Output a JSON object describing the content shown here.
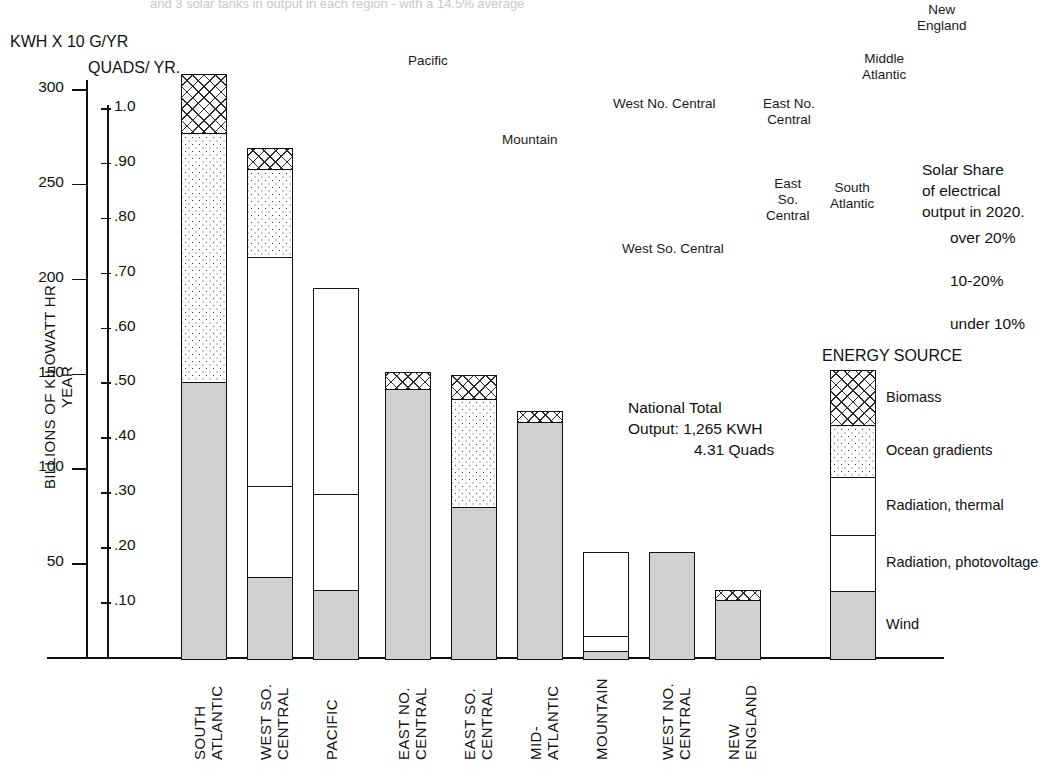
{
  "figure": {
    "cut_top_caption": "and 3 solar tanks in output in each region - with a 14.5% average",
    "kwh_header": "KWH X 10 G/YR",
    "quads_header": "QUADS/\nYR.",
    "y_axis_title": "BILLIONS OF KILOWATT HR YEAR",
    "national_total": "National Total\nOutput: 1,265 KWH\n        4.31 Quads",
    "solar_share_note": "Solar Share\nof electrical\noutput in 2020.",
    "share_bands": [
      "over 20%",
      "10-20%",
      "under 10%"
    ],
    "legend_title": "ENERGY SOURCE"
  },
  "map_region_labels": [
    {
      "name": "Pacific",
      "x": 408,
      "y": 53
    },
    {
      "name": "Mountain",
      "x": 502,
      "y": 132
    },
    {
      "name": "West No. Central",
      "x": 613,
      "y": 96
    },
    {
      "name": "West So. Central",
      "x": 622,
      "y": 241
    },
    {
      "name": "East No.\nCentral",
      "x": 763,
      "y": 96
    },
    {
      "name": "East\nSo.\nCentral",
      "x": 766,
      "y": 176
    },
    {
      "name": "South\nAtlantic",
      "x": 830,
      "y": 180
    },
    {
      "name": "Middle\nAtlantic",
      "x": 862,
      "y": 51
    },
    {
      "name": "New\nEngland",
      "x": 917,
      "y": 2
    }
  ],
  "chart_data": {
    "type": "bar",
    "subtype": "stacked",
    "xlabel": "",
    "ylabel": "BILLIONS OF KILOWATT HR YEAR",
    "ylim": [
      0,
      320
    ],
    "yticks": [
      50,
      100,
      150,
      200,
      250,
      300
    ],
    "secondary_axis": {
      "label": "QUADS/YR.",
      "ticks": [
        ".10",
        ".20",
        ".30",
        ".40",
        ".50",
        ".60",
        ".70",
        ".80",
        ".90",
        "1.0"
      ],
      "values": [
        0.1,
        0.2,
        0.3,
        0.4,
        0.5,
        0.6,
        0.7,
        0.8,
        0.9,
        1.0
      ],
      "range": [
        0,
        1.07
      ]
    },
    "grid": false,
    "legend_position": "right",
    "categories": [
      "SOUTH\nATLANTIC",
      "WEST SO.\nCENTRAL",
      "PACIFIC",
      "EAST NO.\nCENTRAL",
      "EAST SO.\nCENTRAL",
      "MID-\nATLANTIC",
      "MOUNTAIN",
      "WEST NO.\nCENTRAL",
      "NEW\nENGLAND"
    ],
    "series": [
      {
        "name": "Wind",
        "values": [
          146,
          43,
          36,
          142,
          80,
          125,
          4,
          56,
          31
        ]
      },
      {
        "name": "Radiation, photovoltage",
        "values": [
          0,
          48,
          51,
          0,
          0,
          0,
          8,
          0,
          0
        ]
      },
      {
        "name": "Radiation, thermal",
        "values": [
          0,
          121,
          108,
          0,
          0,
          0,
          44,
          0,
          0
        ]
      },
      {
        "name": "Ocean gradients",
        "values": [
          131,
          46,
          0,
          0,
          57,
          0,
          0,
          0,
          0
        ]
      },
      {
        "name": "Biomass",
        "values": [
          31,
          11,
          0,
          9,
          12,
          5,
          0,
          0,
          5
        ]
      }
    ],
    "totals": [
      308,
      269,
      195,
      151,
      149,
      130,
      56,
      56,
      36
    ],
    "units": "billions of kilowatt hours per year",
    "national_total_kwh": "1,265 KWH",
    "national_total_quads": "4.31 Quads"
  },
  "legend": {
    "title": "ENERGY SOURCE",
    "items": [
      {
        "label": "Biomass",
        "pattern": "hatch"
      },
      {
        "label": "Ocean gradients",
        "pattern": "dots"
      },
      {
        "label": "Radiation, thermal",
        "pattern": "white"
      },
      {
        "label": "Radiation, photovoltage",
        "pattern": "white"
      },
      {
        "label": "Wind",
        "pattern": "gray"
      }
    ]
  },
  "annotations": {
    "national_total_line1": "National Total",
    "national_total_line2": "Output: 1,265 KWH",
    "national_total_line3": "4.31 Quads",
    "solar_share_line1": "Solar Share",
    "solar_share_line2": "of electrical",
    "solar_share_line3": "output in 2020.",
    "band1": "over 20%",
    "band2": "10-20%",
    "band3": "under 10%"
  }
}
